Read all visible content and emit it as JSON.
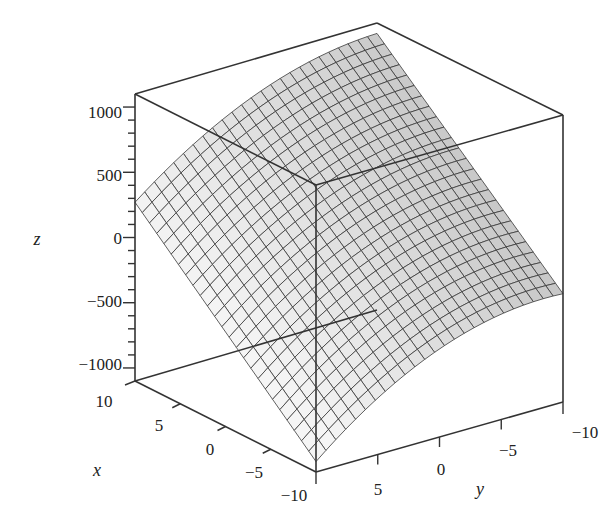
{
  "chart_data": {
    "type": "surface3d",
    "title": "",
    "xlabel": "x",
    "ylabel": "y",
    "zlabel": "z",
    "x_range": [
      -10,
      10
    ],
    "y_range": [
      -10,
      10
    ],
    "z_range": [
      -1100,
      1100
    ],
    "x_ticks": [
      "10",
      "5",
      "0",
      "−5",
      "−10"
    ],
    "y_ticks": [
      "5",
      "0",
      "−5",
      "−10"
    ],
    "z_ticks": [
      "1000",
      "500",
      "0",
      "−500",
      "−1000"
    ],
    "grid_lines_per_axis": 25,
    "corner_values_estimated": [
      {
        "x": 10,
        "y": 10,
        "z": 500
      },
      {
        "x": -10,
        "y": 10,
        "z": -1000
      },
      {
        "x": 10,
        "y": -10,
        "z": 1000
      },
      {
        "x": -10,
        "y": -10,
        "z": -400
      }
    ],
    "shading": "grayscale",
    "boxed_axes": true
  },
  "colors": {
    "background": "#ffffff",
    "box": "#333333",
    "mesh": "#3a3a3a",
    "surface_light": "#f2f2f2",
    "surface_dark": "#6a6a6a"
  }
}
